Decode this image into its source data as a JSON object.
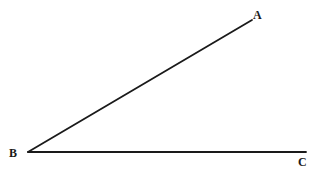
{
  "figure": {
    "type": "geometry-angle-diagram",
    "background_color": "#ffffff",
    "line_color": "#1a1a1a",
    "line_width": 1.8,
    "canvas": {
      "width": 321,
      "height": 172
    },
    "vertex": "B",
    "points": [
      {
        "name": "A",
        "label": "A",
        "x": 252,
        "y": 20,
        "label_x": 259,
        "label_y": 15
      },
      {
        "name": "B",
        "label": "B",
        "x": 28,
        "y": 152,
        "label_x": 14,
        "label_y": 152
      },
      {
        "name": "C",
        "label": "C",
        "x": 306,
        "y": 152,
        "label_x": 303,
        "label_y": 161
      }
    ],
    "rays": [
      {
        "name": "ray-BA",
        "from": "B",
        "to": "A",
        "x1": 28,
        "y1": 152,
        "x2": 252,
        "y2": 20
      },
      {
        "name": "ray-BC",
        "from": "B",
        "to": "C",
        "x1": 28,
        "y1": 152,
        "x2": 306,
        "y2": 152
      }
    ]
  }
}
